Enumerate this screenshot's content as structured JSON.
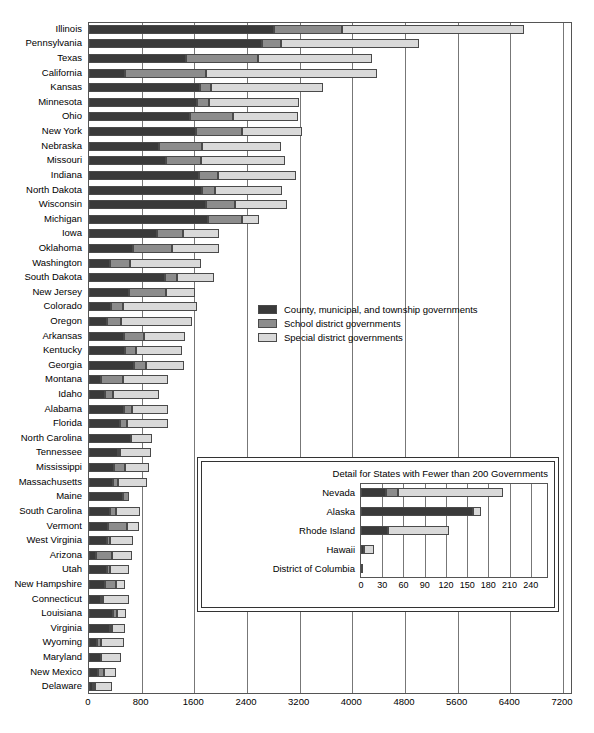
{
  "chart_data": {
    "type": "bar",
    "orientation": "horizontal",
    "stacked": true,
    "title": "",
    "xlabel": "",
    "ylabel": "",
    "xlim": [
      0,
      7200
    ],
    "xticks": [
      0,
      800,
      1600,
      2400,
      3200,
      4000,
      4800,
      5600,
      6400,
      7200
    ],
    "grid": true,
    "legend_position": "center",
    "colors": {
      "county": "#3a3a3a",
      "school": "#8c8c8c",
      "special": "#d9d9d9"
    },
    "series": [
      {
        "name": "County, municipal, and township governments",
        "key": "county"
      },
      {
        "name": "School district governments",
        "key": "school"
      },
      {
        "name": "Special district governments",
        "key": "special"
      }
    ],
    "categories": [
      "Illinois",
      "Pennsylvania",
      "Texas",
      "California",
      "Kansas",
      "Minnesota",
      "Ohio",
      "New York",
      "Nebraska",
      "Missouri",
      "Indiana",
      "North Dakota",
      "Wisconsin",
      "Michigan",
      "Iowa",
      "Oklahoma",
      "Washington",
      "South Dakota",
      "New Jersey",
      "Colorado",
      "Oregon",
      "Arkansas",
      "Kentucky",
      "Georgia",
      "Montana",
      "Idaho",
      "Alabama",
      "Florida",
      "North Carolina",
      "Tennessee",
      "Mississippi",
      "Massachusetts",
      "Maine",
      "South Carolina",
      "Vermont",
      "West Virginia",
      "Arizona",
      "Utah",
      "New Hampshire",
      "Connecticut",
      "Louisiana",
      "Virginia",
      "Wyoming",
      "Maryland",
      "New Mexico",
      "Delaware"
    ],
    "values": {
      "county": [
        2810,
        2630,
        1480,
        540,
        1690,
        1640,
        1530,
        1620,
        1070,
        1170,
        1670,
        1720,
        1780,
        1810,
        1040,
        670,
        320,
        1160,
        600,
        330,
        275,
        530,
        540,
        690,
        180,
        245,
        530,
        470,
        640,
        440,
        380,
        360,
        510,
        320,
        290,
        270,
        110,
        275,
        245,
        180,
        365,
        325,
        120,
        180,
        130,
        60
      ],
      "school": [
        1040,
        290,
        1080,
        1240,
        170,
        190,
        660,
        710,
        640,
        530,
        290,
        200,
        440,
        520,
        385,
        590,
        300,
        170,
        575,
        180,
        210,
        310,
        180,
        180,
        330,
        115,
        130,
        100,
        0,
        14,
        160,
        85,
        100,
        90,
        290,
        55,
        240,
        40,
        170,
        17,
        66,
        1,
        55,
        0,
        96,
        19
      ],
      "special": [
        2760,
        2090,
        1740,
        2600,
        1700,
        1360,
        980,
        910,
        1200,
        1280,
        1190,
        1010,
        790,
        250,
        555,
        715,
        1080,
        570,
        430,
        1130,
        1080,
        620,
        700,
        570,
        690,
        700,
        540,
        630,
        320,
        470,
        370,
        430,
        0,
        360,
        180,
        340,
        305,
        300,
        130,
        400,
        130,
        190,
        360,
        300,
        180,
        260
      ]
    },
    "inset": {
      "title": "Detail for States with Fewer than 200 Governments",
      "xlim": [
        0,
        260
      ],
      "xticks": [
        0,
        30,
        60,
        90,
        120,
        150,
        180,
        210,
        240
      ],
      "categories": [
        "Nevada",
        "Alaska",
        "Rhode Island",
        "Hawaii",
        "District of Columbia"
      ],
      "values": {
        "county": [
          36,
          158,
          38,
          4,
          2
        ],
        "school": [
          16,
          0,
          0,
          0,
          0
        ],
        "special": [
          148,
          12,
          87,
          14,
          0
        ]
      }
    }
  },
  "legend": {
    "items": [
      {
        "label": "County, municipal, and township governments",
        "swatch": "s0"
      },
      {
        "label": "School district governments",
        "swatch": "s1"
      },
      {
        "label": "Special district governments",
        "swatch": "s2"
      }
    ]
  }
}
